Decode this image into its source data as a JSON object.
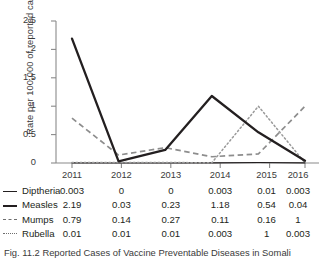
{
  "chart_data": {
    "type": "line",
    "title": "",
    "xlabel": "",
    "ylabel": "Rate per 100,000 of reported cases",
    "categories": [
      "2011",
      "2012",
      "2013",
      "2014",
      "2015",
      "2016"
    ],
    "ylim": [
      0,
      2.5
    ],
    "yticks": [
      "0",
      "0.5",
      "1",
      "1.5",
      "2",
      "2.5"
    ],
    "ytick_values": [
      0,
      0.5,
      1,
      1.5,
      2,
      2.5
    ],
    "grid": false,
    "legend_position": "table-left",
    "series": [
      {
        "name": "Diptheria",
        "style": "solid-thin",
        "color": "#231f20",
        "values": [
          0.003,
          0,
          0,
          0.003,
          0.01,
          0.003
        ],
        "labels": [
          "0.003",
          "0",
          "0",
          "0.003",
          "0.01",
          "0.003"
        ]
      },
      {
        "name": "Measles",
        "style": "solid-thick",
        "color": "#231f20",
        "values": [
          2.19,
          0.03,
          0.23,
          1.18,
          0.54,
          0.04
        ],
        "labels": [
          "2.19",
          "0.03",
          "0.23",
          "1.18",
          "0.54",
          "0.04"
        ]
      },
      {
        "name": "Mumps",
        "style": "dashed",
        "color": "#6e6e6e",
        "values": [
          0.79,
          0.14,
          0.27,
          0.11,
          0.16,
          1
        ],
        "labels": [
          "0.79",
          "0.14",
          "0.27",
          "0.11",
          "0.16",
          "1"
        ]
      },
      {
        "name": "Rubella",
        "style": "dotted",
        "color": "#6e6e6e",
        "values": [
          0.01,
          0.01,
          0.01,
          0.003,
          1,
          0.003
        ],
        "labels": [
          "0.01",
          "0.01",
          "0.01",
          "0.003",
          "1",
          "0.003"
        ]
      }
    ]
  },
  "axis": {
    "y_title": "Rate per 100,000 of reported cases",
    "y_ticks": [
      "2.5",
      "2",
      "1.5",
      "1",
      "0.5",
      "0"
    ],
    "x_ticks": [
      "2011",
      "2012",
      "2013",
      "2014",
      "2015",
      "2016"
    ]
  },
  "table": {
    "rows": [
      {
        "name": "Diptheria",
        "marker": "solid-thin",
        "cells": [
          "0.003",
          "0",
          "0",
          "0.003",
          "0.01",
          "0.003"
        ]
      },
      {
        "name": "Measles",
        "marker": "solid-thick",
        "cells": [
          "2.19",
          "0.03",
          "0.23",
          "1.18",
          "0.54",
          "0.04"
        ]
      },
      {
        "name": "Mumps",
        "marker": "dashed",
        "cells": [
          "0.79",
          "0.14",
          "0.27",
          "0.11",
          "0.16",
          "1"
        ]
      },
      {
        "name": "Rubella",
        "marker": "dotted",
        "cells": [
          "0.01",
          "0.01",
          "0.01",
          "0.003",
          "1",
          "0.003"
        ]
      }
    ]
  },
  "caption": {
    "text": "Fig. 11.2 Reported Cases of Vaccine Preventable Diseases in Somali"
  }
}
